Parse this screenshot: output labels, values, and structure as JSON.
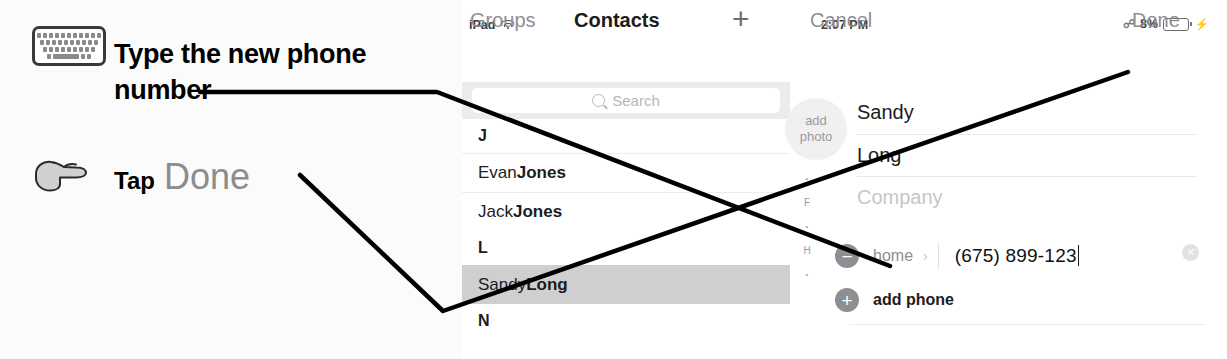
{
  "annotations": {
    "keyboard_icon": "keyboard-icon",
    "hand_icon": "pointing-hand-icon",
    "instruction_1": "Type the new phone number",
    "instruction_2_prefix": "Tap",
    "instruction_2_target": "Done",
    "line_color": "#000000"
  },
  "ipad": {
    "statusbar": {
      "device": "iPad",
      "wifi_icon": "wifi-icon",
      "time": "2:07 PM",
      "bluetooth_icon": "bluetooth-icon",
      "battery_percent": "8%",
      "battery_icon": "battery-icon",
      "charging_icon": "lightning-bolt-icon"
    },
    "navbar": {
      "groups_label": "Groups",
      "title": "Contacts",
      "add_icon": "plus-icon",
      "cancel_label": "Cancel",
      "done_label": "Done"
    },
    "search": {
      "icon": "search-icon",
      "placeholder": "Search"
    },
    "contacts_list": [
      {
        "type": "header",
        "label": "J"
      },
      {
        "type": "contact",
        "first": "Evan ",
        "last": "Jones",
        "selected": false
      },
      {
        "type": "contact",
        "first": "Jack ",
        "last": "Jones",
        "selected": false
      },
      {
        "type": "header",
        "label": "L"
      },
      {
        "type": "contact",
        "first": "Sandy ",
        "last": "Long",
        "selected": true
      },
      {
        "type": "header",
        "label": "N"
      }
    ],
    "index_bar": [
      "A",
      "•",
      "C",
      "•",
      "F",
      "•",
      "H",
      "•"
    ],
    "detail": {
      "add_photo_line1": "add",
      "add_photo_line2": "photo",
      "first_name": "Sandy",
      "last_name": "Long",
      "company_placeholder": "Company",
      "phone": {
        "remove_icon": "minus-circle-icon",
        "label": "home",
        "chevron_icon": "chevron-right-icon",
        "value": "(675) 899-123",
        "clear_icon": "clear-circle-icon"
      },
      "add_phone": {
        "add_icon": "plus-circle-icon",
        "label": "add phone"
      }
    }
  }
}
